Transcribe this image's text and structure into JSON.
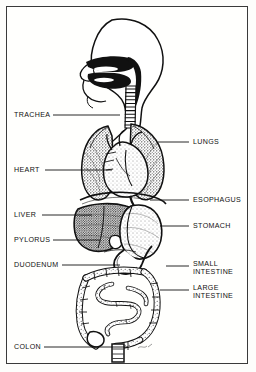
{
  "figure": {
    "style": "black-and-white stippled line engraving",
    "background_color": "#fffffd",
    "ink_color": "#111111",
    "border_color": "#3a3a3a"
  },
  "labels": {
    "left": [
      {
        "id": "trachea",
        "text": "TRACHEA",
        "x": 14,
        "y": 117,
        "leader_x1": 53,
        "leader_x2": 120,
        "leader_y": 115
      },
      {
        "id": "heart",
        "text": "HEART",
        "x": 14,
        "y": 172,
        "leader_x1": 45,
        "leader_x2": 112,
        "leader_y": 170
      },
      {
        "id": "liver",
        "text": "LIVER",
        "x": 14,
        "y": 217,
        "leader_x1": 42,
        "leader_x2": 92,
        "leader_y": 215
      },
      {
        "id": "pylorus",
        "text": "PYLORUS",
        "x": 14,
        "y": 242,
        "leader_x1": 53,
        "leader_x2": 100,
        "leader_y": 240
      },
      {
        "id": "duodenum",
        "text": "DUODENUM",
        "x": 14,
        "y": 267,
        "leader_x1": 62,
        "leader_x2": 120,
        "leader_y": 265
      },
      {
        "id": "colon",
        "text": "COLON",
        "x": 14,
        "y": 349,
        "leader_x1": 44,
        "leader_x2": 128,
        "leader_y": 347
      }
    ],
    "right": [
      {
        "id": "lungs",
        "text": "LUNGS",
        "x": 193,
        "y": 144,
        "leader_x1": 158,
        "leader_x2": 189,
        "leader_y": 142
      },
      {
        "id": "esophagus",
        "text": "ESOPHAGUS",
        "x": 193,
        "y": 202,
        "leader_x1": 150,
        "leader_x2": 189,
        "leader_y": 200
      },
      {
        "id": "stomach",
        "text": "STOMACH",
        "x": 193,
        "y": 228,
        "leader_x1": 160,
        "leader_x2": 189,
        "leader_y": 226
      },
      {
        "id": "small-intestine",
        "text": "SMALL\nINTESTINE",
        "x": 193,
        "y": 266,
        "leader_x1": 166,
        "leader_x2": 189,
        "leader_y": 266
      },
      {
        "id": "large-intestine",
        "text": "LARGE\nINTESTINE",
        "x": 193,
        "y": 290,
        "leader_x1": 160,
        "leader_x2": 189,
        "leader_y": 290
      }
    ]
  }
}
